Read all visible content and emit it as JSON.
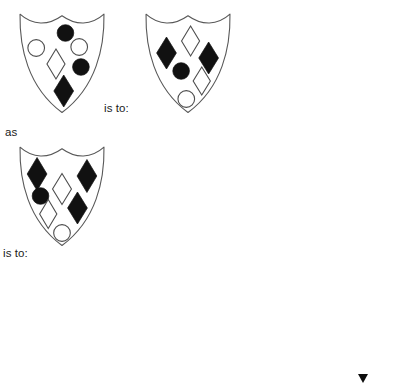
{
  "page": {
    "kind": "visual-analogy-puzzle",
    "width": 406,
    "height": 386,
    "background_color": "#ffffff",
    "outline_color": "#585858",
    "filled_color": "#111111",
    "open_fill_color": "#ffffff"
  },
  "labels": {
    "is_to_1": "is to:",
    "as": "as",
    "is_to_2": "is to:"
  },
  "prompt_shields": [
    {
      "id": "prompt-a",
      "role": "analogy-term-1",
      "x": 19,
      "y": 13,
      "w": 86,
      "h": 100,
      "symbols": [
        {
          "shape": "circle",
          "fill": "filled",
          "cx": 0.54,
          "cy": 0.2,
          "r": 0.095
        },
        {
          "shape": "circle",
          "fill": "open",
          "cx": 0.2,
          "cy": 0.35,
          "r": 0.095
        },
        {
          "shape": "circle",
          "fill": "open",
          "cx": 0.7,
          "cy": 0.34,
          "r": 0.095
        },
        {
          "shape": "diamond",
          "fill": "open",
          "cx": 0.43,
          "cy": 0.51,
          "rx": 0.105,
          "ry": 0.15
        },
        {
          "shape": "circle",
          "fill": "filled",
          "cx": 0.72,
          "cy": 0.54,
          "r": 0.095
        },
        {
          "shape": "diamond",
          "fill": "filled",
          "cx": 0.52,
          "cy": 0.78,
          "rx": 0.115,
          "ry": 0.16
        }
      ]
    },
    {
      "id": "prompt-b",
      "role": "analogy-term-2",
      "x": 145,
      "y": 13,
      "w": 86,
      "h": 100,
      "symbols": [
        {
          "shape": "diamond",
          "fill": "open",
          "cx": 0.53,
          "cy": 0.28,
          "rx": 0.105,
          "ry": 0.15
        },
        {
          "shape": "diamond",
          "fill": "filled",
          "cx": 0.25,
          "cy": 0.4,
          "rx": 0.115,
          "ry": 0.16
        },
        {
          "shape": "diamond",
          "fill": "filled",
          "cx": 0.74,
          "cy": 0.45,
          "rx": 0.115,
          "ry": 0.16
        },
        {
          "shape": "circle",
          "fill": "filled",
          "cx": 0.42,
          "cy": 0.58,
          "r": 0.095
        },
        {
          "shape": "diamond",
          "fill": "open",
          "cx": 0.66,
          "cy": 0.68,
          "rx": 0.1,
          "ry": 0.14
        },
        {
          "shape": "circle",
          "fill": "open",
          "cx": 0.48,
          "cy": 0.86,
          "r": 0.095
        }
      ]
    },
    {
      "id": "prompt-c",
      "role": "analogy-term-3",
      "x": 19,
      "y": 146,
      "w": 86,
      "h": 100,
      "symbols": [
        {
          "shape": "diamond",
          "fill": "filled",
          "cx": 0.21,
          "cy": 0.28,
          "rx": 0.115,
          "ry": 0.165
        },
        {
          "shape": "diamond",
          "fill": "filled",
          "cx": 0.79,
          "cy": 0.3,
          "rx": 0.115,
          "ry": 0.165
        },
        {
          "shape": "diamond",
          "fill": "open",
          "cx": 0.5,
          "cy": 0.43,
          "rx": 0.11,
          "ry": 0.155
        },
        {
          "shape": "circle",
          "fill": "filled",
          "cx": 0.25,
          "cy": 0.5,
          "r": 0.095
        },
        {
          "shape": "diamond",
          "fill": "filled",
          "cx": 0.68,
          "cy": 0.62,
          "rx": 0.115,
          "ry": 0.16
        },
        {
          "shape": "diamond",
          "fill": "open",
          "cx": 0.34,
          "cy": 0.68,
          "rx": 0.1,
          "ry": 0.145
        },
        {
          "shape": "circle",
          "fill": "open",
          "cx": 0.5,
          "cy": 0.87,
          "r": 0.095
        }
      ]
    }
  ],
  "options": [
    {
      "id": "option-1",
      "label": "A",
      "x": 16,
      "y": 277,
      "w": 88,
      "h": 102,
      "symbols": [
        {
          "shape": "circle",
          "fill": "filled",
          "cx": 0.22,
          "cy": 0.16,
          "r": 0.095
        },
        {
          "shape": "circle",
          "fill": "filled",
          "cx": 0.8,
          "cy": 0.21,
          "r": 0.095
        },
        {
          "shape": "diamond",
          "fill": "filled",
          "cx": 0.23,
          "cy": 0.37,
          "rx": 0.115,
          "ry": 0.16
        },
        {
          "shape": "circle",
          "fill": "open",
          "cx": 0.62,
          "cy": 0.41,
          "r": 0.095
        },
        {
          "shape": "circle",
          "fill": "filled",
          "cx": 0.74,
          "cy": 0.56,
          "r": 0.095
        },
        {
          "shape": "circle",
          "fill": "open",
          "cx": 0.32,
          "cy": 0.61,
          "r": 0.095
        },
        {
          "shape": "diamond",
          "fill": "open",
          "cx": 0.52,
          "cy": 0.79,
          "rx": 0.105,
          "ry": 0.15
        }
      ]
    },
    {
      "id": "option-2",
      "label": "B",
      "x": 114,
      "y": 277,
      "w": 88,
      "h": 102,
      "symbols": [
        {
          "shape": "circle",
          "fill": "filled",
          "cx": 0.22,
          "cy": 0.17,
          "r": 0.095
        },
        {
          "shape": "circle",
          "fill": "filled",
          "cx": 0.79,
          "cy": 0.21,
          "r": 0.095
        },
        {
          "shape": "diamond",
          "fill": "open",
          "cx": 0.25,
          "cy": 0.39,
          "rx": 0.11,
          "ry": 0.155
        },
        {
          "shape": "circle",
          "fill": "open",
          "cx": 0.55,
          "cy": 0.41,
          "r": 0.095
        },
        {
          "shape": "circle",
          "fill": "open",
          "cx": 0.31,
          "cy": 0.61,
          "r": 0.095
        },
        {
          "shape": "circle",
          "fill": "filled",
          "cx": 0.73,
          "cy": 0.58,
          "r": 0.095
        },
        {
          "shape": "diamond",
          "fill": "filled",
          "cx": 0.52,
          "cy": 0.79,
          "rx": 0.115,
          "ry": 0.16
        }
      ]
    },
    {
      "id": "option-3",
      "label": "C",
      "x": 212,
      "y": 277,
      "w": 88,
      "h": 102,
      "symbols": [
        {
          "shape": "circle",
          "fill": "open",
          "cx": 0.21,
          "cy": 0.17,
          "r": 0.095
        },
        {
          "shape": "circle",
          "fill": "open",
          "cx": 0.8,
          "cy": 0.18,
          "r": 0.095
        },
        {
          "shape": "diamond",
          "fill": "open",
          "cx": 0.26,
          "cy": 0.4,
          "rx": 0.11,
          "ry": 0.155
        },
        {
          "shape": "circle",
          "fill": "filled",
          "cx": 0.61,
          "cy": 0.4,
          "r": 0.095
        },
        {
          "shape": "circle",
          "fill": "open",
          "cx": 0.77,
          "cy": 0.55,
          "r": 0.095
        },
        {
          "shape": "circle",
          "fill": "filled",
          "cx": 0.35,
          "cy": 0.6,
          "r": 0.095
        },
        {
          "shape": "diamond",
          "fill": "open",
          "cx": 0.53,
          "cy": 0.78,
          "rx": 0.105,
          "ry": 0.15
        }
      ]
    },
    {
      "id": "option-4",
      "label": "D",
      "x": 310,
      "y": 277,
      "w": 88,
      "h": 102,
      "symbols": [
        {
          "shape": "circle",
          "fill": "open",
          "cx": 0.21,
          "cy": 0.17,
          "r": 0.095
        },
        {
          "shape": "circle",
          "fill": "open",
          "cx": 0.8,
          "cy": 0.18,
          "r": 0.095
        },
        {
          "shape": "diamond",
          "fill": "open",
          "cx": 0.26,
          "cy": 0.4,
          "rx": 0.11,
          "ry": 0.155
        },
        {
          "shape": "circle",
          "fill": "filled",
          "cx": 0.58,
          "cy": 0.4,
          "r": 0.095
        },
        {
          "shape": "circle",
          "fill": "open",
          "cx": 0.77,
          "cy": 0.54,
          "r": 0.095
        },
        {
          "shape": "circle",
          "fill": "filled",
          "cx": 0.33,
          "cy": 0.59,
          "r": 0.095
        },
        {
          "shape": "diamond",
          "fill": "filled",
          "cx": 0.53,
          "cy": 0.78,
          "rx": 0.115,
          "ry": 0.16
        }
      ]
    }
  ],
  "cursor_marker": {
    "visible": true,
    "shape": "triangle",
    "color": "#0d0d0d"
  }
}
